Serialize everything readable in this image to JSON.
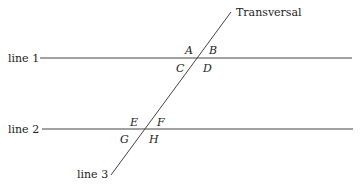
{
  "diagram": {
    "lines": {
      "line1": {
        "label": "line 1"
      },
      "line2": {
        "label": "line 2"
      },
      "line3": {
        "label": "line 3"
      },
      "transversal": {
        "label": "Transversal"
      }
    },
    "angles": {
      "top_intersection": [
        "A",
        "B",
        "C",
        "D"
      ],
      "bottom_intersection": [
        "E",
        "F",
        "G",
        "H"
      ]
    },
    "colors": {
      "stroke": "#444444",
      "text": "#222222",
      "background": "#ffffff"
    }
  }
}
